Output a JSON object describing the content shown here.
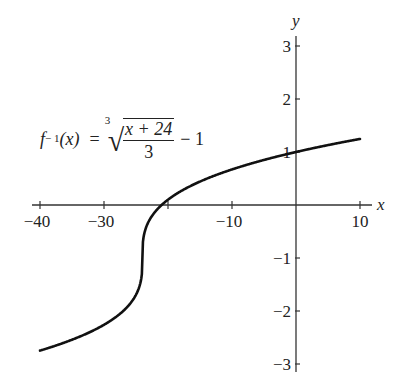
{
  "chart_data": {
    "type": "line",
    "title": "",
    "function": "f^{-1}(x) = cbrt((x + 24)/3) - 1",
    "xlabel": "x",
    "ylabel": "y",
    "xlim": [
      -40,
      10
    ],
    "ylim": [
      -3,
      3
    ],
    "grid": false,
    "x_ticks": [
      -40,
      -30,
      -20,
      -10,
      0,
      10
    ],
    "x_tick_labels": [
      "−40",
      "−30",
      "−10",
      "10"
    ],
    "y_ticks": [
      -3,
      -2,
      -1,
      1,
      2,
      3
    ],
    "y_tick_labels": [
      "−3",
      "−2",
      "−1",
      "1",
      "2",
      "3"
    ],
    "series": [
      {
        "name": "f^{-1}(x)",
        "x": [
          -40,
          -36,
          -32,
          -28,
          -26,
          -25,
          -24.5,
          -24,
          -23.5,
          -23,
          -22,
          -20,
          -16,
          -12,
          -8,
          -4,
          0,
          4,
          8,
          10
        ],
        "y": [
          -2.75,
          -2.59,
          -2.39,
          -2.1,
          -1.87,
          -1.69,
          -1.55,
          -1.0,
          -0.45,
          -0.31,
          -0.13,
          0.1,
          0.39,
          0.59,
          0.76,
          0.9,
          1.0,
          1.11,
          1.2,
          1.25
        ]
      }
    ],
    "annotations": [
      {
        "text": "f⁻¹(x) = ∛((x + 24)/3) − 1",
        "position": "upper-left"
      }
    ]
  },
  "formula": {
    "lhs_f": "f",
    "lhs_sup": "− 1",
    "lhs_arg": "(x)",
    "equals": "=",
    "root_index": "3",
    "numerator": "x + 24",
    "denominator": "3",
    "tail": "− 1"
  },
  "axes": {
    "x_label": "x",
    "y_label": "y",
    "x_tick_labels": [
      {
        "value": -40,
        "label": "−40"
      },
      {
        "value": -30,
        "label": "−30"
      },
      {
        "value": -10,
        "label": "−10"
      },
      {
        "value": 10,
        "label": "10"
      }
    ],
    "y_tick_labels": [
      {
        "value": 3,
        "label": "3"
      },
      {
        "value": 2,
        "label": "2"
      },
      {
        "value": 1,
        "label": "1"
      },
      {
        "value": -1,
        "label": "−1"
      },
      {
        "value": -2,
        "label": "−2"
      },
      {
        "value": -3,
        "label": "−3"
      }
    ]
  },
  "colors": {
    "curve": "#111111",
    "axis": "#333333",
    "background": "#ffffff"
  }
}
